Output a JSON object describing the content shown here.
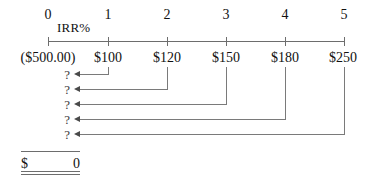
{
  "diagram": {
    "rate_label": "IRR%",
    "periods": [
      {
        "index": "0",
        "cash_flow": "($500.00)"
      },
      {
        "index": "1",
        "cash_flow": "$100"
      },
      {
        "index": "2",
        "cash_flow": "$120"
      },
      {
        "index": "3",
        "cash_flow": "$150"
      },
      {
        "index": "4",
        "cash_flow": "$180"
      },
      {
        "index": "5",
        "cash_flow": "$250"
      }
    ],
    "discount_rows": [
      {
        "from_period": "1",
        "present_value": "?"
      },
      {
        "from_period": "2",
        "present_value": "?"
      },
      {
        "from_period": "3",
        "present_value": "?"
      },
      {
        "from_period": "4",
        "present_value": "?"
      },
      {
        "from_period": "5",
        "present_value": "?"
      }
    ],
    "total": {
      "currency_symbol": "$",
      "value": "0"
    },
    "colors": {
      "text": "#111111",
      "axis": "#6d6d6d",
      "connector": "#7a7a7a",
      "arrow": "#4a4a4a",
      "background": "#ffffff"
    }
  }
}
